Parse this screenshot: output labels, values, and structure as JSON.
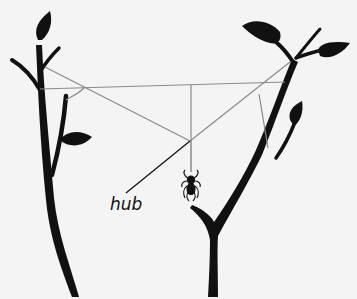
{
  "diagram": {
    "labels": {
      "hub": "hub"
    },
    "elements": [
      "left-plant",
      "right-plant",
      "web-threads",
      "hub",
      "spider"
    ],
    "colors": {
      "background": "#f4f4f4",
      "plant": "#111111",
      "thread": "#8a8a8a",
      "label_line": "#111111"
    }
  }
}
